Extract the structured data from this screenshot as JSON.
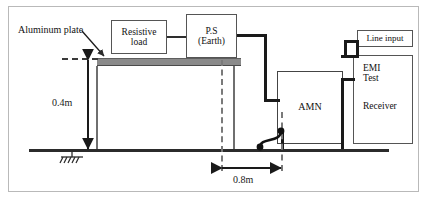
{
  "diagram": {
    "annotations": {
      "aluminum_plate": "Aluminum plate",
      "height_dimension": "0.4m",
      "distance_dimension": "0.8m"
    },
    "boxes": {
      "resistive_load": {
        "line1": "Resistive",
        "line2": "load"
      },
      "ps_earth": {
        "line1": "P.S",
        "line2": "(Earth)"
      },
      "amn": {
        "line1": "AMN"
      },
      "line_input": {
        "line1": "Line input"
      },
      "emi_receiver": {
        "line1": "EMI",
        "line2": "Test",
        "line3": "Receiver"
      }
    },
    "symbols": {
      "earth_ground": "earth-ground-symbol",
      "bond_strap": "ground-bond-strap"
    },
    "colors": {
      "plate": "#8a8a8a",
      "wire": "#1a1a1a",
      "ground": "#2b2b2b",
      "dashed": "#7a7a7a",
      "frame": "#b9b9b9"
    }
  }
}
